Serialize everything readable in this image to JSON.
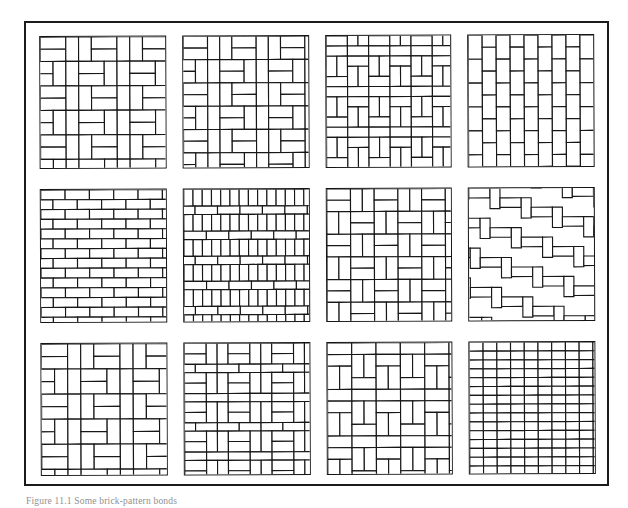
{
  "page": {
    "width": 628,
    "height": 508,
    "background_color": "#ffffff",
    "ink_color": "#171717"
  },
  "plate": {
    "name": "brick-bond-pattern-plate",
    "frame_color": "#1b1b1b",
    "columns": 4,
    "rows": 3,
    "panel_count": 12
  },
  "caption": {
    "text": "Figure 11.1  Some brick-pattern bonds",
    "clipped": "true"
  },
  "panels": [
    {
      "index": 1,
      "row": 1,
      "column": 1,
      "name": "panel-basketweave-double-offset",
      "pattern": "basketweave-double",
      "label": "Basket weave (double, offset courses)"
    },
    {
      "index": 2,
      "row": 1,
      "column": 2,
      "name": "panel-basketweave-pinwheel",
      "pattern": "basketweave-pinwheel",
      "label": "Basket weave pinwheel"
    },
    {
      "index": 3,
      "row": 1,
      "column": 3,
      "name": "panel-basketweave-dense",
      "pattern": "basketweave-dense",
      "label": "Basket weave (dense, half-drop)"
    },
    {
      "index": 4,
      "row": 1,
      "column": 4,
      "name": "panel-running-bond-vertical",
      "pattern": "running-bond-vertical",
      "label": "Vertical running bond (soldier)"
    },
    {
      "index": 5,
      "row": 2,
      "column": 1,
      "name": "panel-running-bond-horizontal",
      "pattern": "running-bond-horizontal",
      "label": "Running bond (stretcher)"
    },
    {
      "index": 6,
      "row": 2,
      "column": 2,
      "name": "panel-stretcher-soldier-courses",
      "pattern": "stretcher-soldier-alternating",
      "label": "Alternating stretcher and soldier courses"
    },
    {
      "index": 7,
      "row": 2,
      "column": 3,
      "name": "panel-basketweave-square",
      "pattern": "basketweave-square",
      "label": "Square basket weave"
    },
    {
      "index": 8,
      "row": 2,
      "column": 4,
      "name": "panel-herringbone",
      "pattern": "herringbone",
      "label": "Herringbone"
    },
    {
      "index": 9,
      "row": 3,
      "column": 1,
      "name": "panel-basketweave-staggered",
      "pattern": "basketweave-staggered",
      "label": "Staggered basket weave"
    },
    {
      "index": 10,
      "row": 3,
      "column": 2,
      "name": "panel-basketweave-banded",
      "pattern": "basketweave-banded",
      "label": "Banded basket weave"
    },
    {
      "index": 11,
      "row": 3,
      "column": 3,
      "name": "panel-basketweave-alternating",
      "pattern": "basketweave-alternating",
      "label": "Alternating basket weave"
    },
    {
      "index": 12,
      "row": 3,
      "column": 4,
      "name": "panel-stack-bond",
      "pattern": "stack-bond",
      "label": "Stack bond (grid)"
    }
  ]
}
